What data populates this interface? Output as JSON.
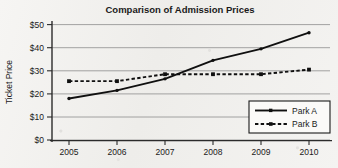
{
  "chart_data": {
    "type": "line",
    "title": "Comparison of Admission Prices",
    "xlabel": "",
    "ylabel": "Ticket Price",
    "categories": [
      "2005",
      "2006",
      "2007",
      "2008",
      "2009",
      "2010"
    ],
    "x": [
      2005,
      2006,
      2007,
      2008,
      2009,
      2010
    ],
    "series": [
      {
        "name": "Park A",
        "values": [
          18,
          21.5,
          26.5,
          34.5,
          39.5,
          46.5
        ],
        "line_style": "solid",
        "marker": "dot",
        "color": "#101010"
      },
      {
        "name": "Park B",
        "values": [
          25.5,
          25.5,
          28.5,
          28.5,
          28.5,
          30.5
        ],
        "line_style": "dashed",
        "marker": "square",
        "color": "#101010"
      }
    ],
    "ylim": [
      0,
      50
    ],
    "ytick_values": [
      0,
      10,
      20,
      30,
      40,
      50
    ],
    "ytick_labels": [
      "$0",
      "$10",
      "$20",
      "$30",
      "$40",
      "$50"
    ],
    "xtick_labels": [
      "2005",
      "2006",
      "2007",
      "2008",
      "2009",
      "2010"
    ],
    "grid": "horizontal",
    "legend_position": "lower-right",
    "legend_entries": [
      "Park A",
      "Park B"
    ]
  }
}
